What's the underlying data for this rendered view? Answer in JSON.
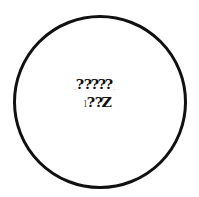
{
  "figure": {
    "shape": "circle",
    "stroke_color": "#111111",
    "background_color": "#ffffff"
  },
  "text_rows": [
    {
      "leading_mark": ".",
      "glyphs": [
        "?",
        "?",
        "?",
        "?",
        "?"
      ],
      "trailing_mark": "."
    },
    {
      "leading_mark": "l",
      "glyphs": [
        "?",
        "?",
        "Z"
      ]
    }
  ]
}
